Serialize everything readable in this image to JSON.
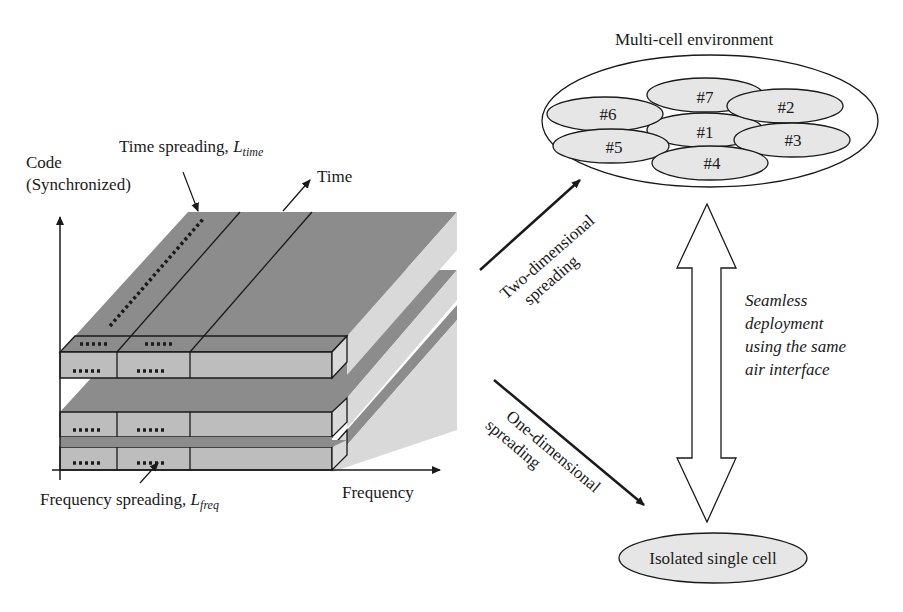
{
  "left_panel": {
    "y_axis_label_line1": "Code",
    "y_axis_label_line2": "(Synchronized)",
    "x_axis_label": "Frequency",
    "time_axis_label": "Time",
    "time_spreading_label": "Time spreading, ",
    "time_spreading_symbol": "L",
    "time_spreading_subscript": "time",
    "freq_spreading_label": "Frequency spreading, ",
    "freq_spreading_symbol": "L",
    "freq_spreading_subscript": "freq",
    "slab_count": 3
  },
  "middle": {
    "two_dim_line1": "Two-dimensional",
    "two_dim_line2": "spreading",
    "one_dim_line1": "One-dimensional",
    "one_dim_line2": "spreading"
  },
  "right_panel": {
    "multi_cell_title": "Multi-cell environment",
    "cells": [
      "#1",
      "#2",
      "#3",
      "#4",
      "#5",
      "#6",
      "#7"
    ],
    "seamless_line1": "Seamless",
    "seamless_line2": "deployment",
    "seamless_line3": "using the same",
    "seamless_line4": "air interface",
    "isolated_cell_label": "Isolated single cell"
  },
  "colors": {
    "top_face": "#8c8c8c",
    "front_face": "#bdbdbd",
    "side_face": "#d9d9d9",
    "cell_fill": "#e6e6e6",
    "line": "#1a1a1a"
  }
}
